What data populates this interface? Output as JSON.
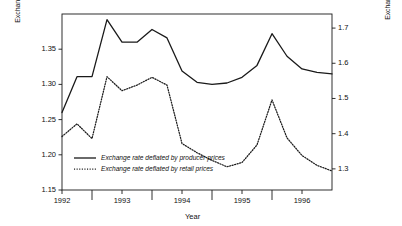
{
  "chart_data": {
    "type": "line",
    "title": "",
    "xlabel": "Year",
    "ylabel_left": "Exchange rate deflated by retail prices (January 1992 = 1)",
    "ylabel_right": "Exchange rate deflated by producer prices (January 1992 = 1)",
    "grid": false,
    "legend_position": "inside-lower-left",
    "x_tick_labels": [
      "1992",
      "1993",
      "1994",
      "1995",
      "1996"
    ],
    "x_major_ticks": [
      1992,
      1993,
      1994,
      1995,
      1996
    ],
    "x_minor_ticks": [
      1992.5,
      1993.5,
      1994.5,
      1995.5
    ],
    "xlim": [
      1992.0,
      1996.5
    ],
    "ylim_left": [
      1.15,
      1.4
    ],
    "ylim_right": [
      1.24,
      1.74
    ],
    "y_left_tick_labels": [
      "1.15",
      "1.20",
      "1.25",
      "1.30",
      "1.35"
    ],
    "y_left_tick_values": [
      1.15,
      1.2,
      1.25,
      1.3,
      1.35
    ],
    "y_right_tick_labels": [
      "1.3",
      "1.4",
      "1.5",
      "1.6",
      "1.7"
    ],
    "y_right_tick_values": [
      1.3,
      1.4,
      1.5,
      1.6,
      1.7
    ],
    "series": [
      {
        "name": "Exchange rate deflated by producer prices",
        "style": "solid",
        "axis": "right",
        "color": "#1a1a1a",
        "x": [
          1992.0,
          1992.25,
          1992.5,
          1992.75,
          1993.0,
          1993.25,
          1993.5,
          1993.75,
          1994.0,
          1994.25,
          1994.5,
          1994.75,
          1995.0,
          1995.25,
          1995.5,
          1995.75,
          1996.0,
          1996.25,
          1996.5
        ],
        "values_left_scale": [
          1.26,
          1.311,
          1.311,
          1.392,
          1.36,
          1.36,
          1.378,
          1.366,
          1.319,
          1.303,
          1.3,
          1.302,
          1.31,
          1.327,
          1.372,
          1.34,
          1.322,
          1.317,
          1.315
        ],
        "values_right_scale": [
          1.461,
          1.563,
          1.563,
          1.725,
          1.661,
          1.661,
          1.697,
          1.673,
          1.579,
          1.546,
          1.541,
          1.545,
          1.561,
          1.594,
          1.685,
          1.621,
          1.585,
          1.575,
          1.571
        ]
      },
      {
        "name": "Exchange rate deflated by retail prices",
        "style": "dotted",
        "axis": "left",
        "color": "#1a1a1a",
        "x": [
          1992.0,
          1992.25,
          1992.5,
          1992.75,
          1993.0,
          1993.25,
          1993.5,
          1993.75,
          1994.0,
          1994.25,
          1994.5,
          1994.75,
          1995.0,
          1995.25,
          1995.5,
          1995.75,
          1996.0,
          1996.25,
          1996.5
        ],
        "values_left_scale": [
          1.226,
          1.244,
          1.223,
          1.311,
          1.291,
          1.299,
          1.31,
          1.299,
          1.216,
          1.203,
          1.192,
          1.183,
          1.189,
          1.214,
          1.278,
          1.224,
          1.199,
          1.185,
          1.177
        ]
      }
    ],
    "legend": [
      {
        "label": "Exchange rate deflated by producer prices",
        "style": "solid"
      },
      {
        "label": "Exchange rate deflated by retail prices",
        "style": "dotted"
      }
    ]
  }
}
